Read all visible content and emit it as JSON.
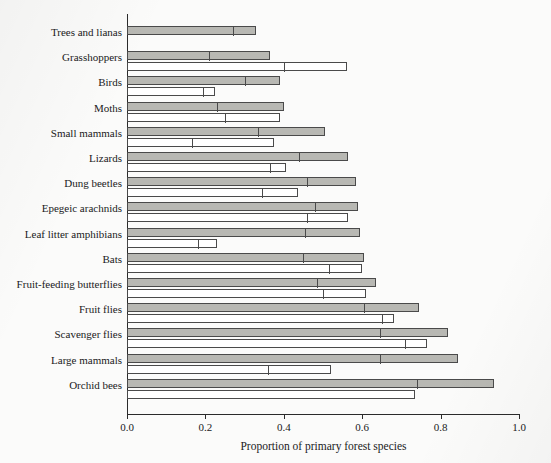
{
  "chart_data": {
    "type": "bar",
    "orientation": "horizontal",
    "title": "",
    "xlabel": "Proportion of primary forest species",
    "ylabel": "",
    "xlim": [
      0.0,
      1.0
    ],
    "xticks": [
      0.0,
      0.2,
      0.4,
      0.6,
      0.8,
      1.0
    ],
    "xticklabels": [
      "0.0",
      "0.2",
      "0.4",
      "0.6",
      "0.8",
      "1.0"
    ],
    "grid": false,
    "legend": "none",
    "note": "Each taxon has up to two stacked-segment bars: an upper shaded (gray) bar and a lower open (white) bar. Each bar is divided by an internal vertical line into a first segment and a second segment; 'end' is the total bar length.",
    "categories": [
      "Trees and lianas",
      "Grasshoppers",
      "Birds",
      "Moths",
      "Small mammals",
      "Lizards",
      "Dung beetles",
      "Epegeic arachnids",
      "Leaf litter amphibians",
      "Bats",
      "Fruit-feeding butterflies",
      "Fruit flies",
      "Scavenger flies",
      "Large mammals",
      "Orchid bees"
    ],
    "series": [
      {
        "name": "shaded bar",
        "style": "gray",
        "divider": [
          0.27,
          0.21,
          0.3,
          0.23,
          0.335,
          0.44,
          0.46,
          0.48,
          0.455,
          0.45,
          0.485,
          0.605,
          0.645,
          0.645,
          0.74
        ],
        "values": [
          0.33,
          0.365,
          0.39,
          0.4,
          0.505,
          0.565,
          0.585,
          0.59,
          0.595,
          0.605,
          0.635,
          0.745,
          0.82,
          0.845,
          0.935
        ]
      },
      {
        "name": "open bar",
        "style": "white",
        "divider": [
          null,
          0.4,
          0.195,
          0.25,
          0.165,
          0.365,
          0.345,
          0.46,
          0.18,
          0.515,
          0.5,
          0.65,
          0.71,
          0.36,
          null
        ],
        "values": [
          null,
          0.56,
          0.225,
          0.39,
          0.375,
          0.405,
          0.435,
          0.565,
          0.23,
          0.6,
          0.61,
          0.68,
          0.765,
          0.52,
          0.735
        ]
      }
    ]
  },
  "colors": {
    "bar_fill_shaded": "#b8b8b3",
    "bar_fill_open": "#ffffff",
    "bar_stroke": "#4a4a4a",
    "axis": "#2b2b2b",
    "text": "#1a1a1a",
    "background": "#fbfbfa"
  }
}
